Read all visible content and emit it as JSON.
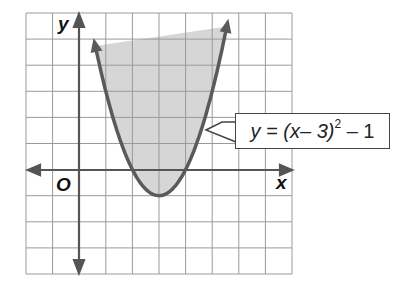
{
  "chart_data": {
    "type": "line",
    "title": "",
    "function": "y = (x - 3)^2 - 1",
    "xlabel": "x",
    "ylabel": "y",
    "origin_label": "O",
    "xlim": [
      -2,
      8
    ],
    "ylim": [
      -4,
      6
    ],
    "grid": true,
    "grid_step": 1,
    "shaded_region": "inside parabola (y > (x-3)^2 - 1)",
    "vertex": [
      3,
      -1
    ],
    "x_intercepts": [
      2,
      4
    ],
    "annotation": {
      "text": "y = (x– 3)² – 1",
      "points_to": [
        5.0,
        3.0
      ]
    },
    "series": [
      {
        "name": "y = (x-3)^2 - 1",
        "x": [
          0.35,
          1,
          2,
          3,
          4,
          5,
          5.65
        ],
        "values": [
          6,
          3,
          0,
          -1,
          0,
          3,
          6
        ]
      }
    ]
  },
  "labels": {
    "y": "y",
    "x": "x",
    "origin": "O",
    "eq_main": "y = (x– 3)",
    "eq_exp": "2",
    "eq_tail": " – 1"
  },
  "colors": {
    "grid": "#9a9a9a",
    "axis": "#555555",
    "curve": "#5a5a5a",
    "shade": "#d6d6d6"
  }
}
